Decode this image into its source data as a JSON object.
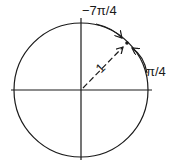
{
  "diagram": {
    "type": "unit-circle",
    "labels": {
      "top_angle": "−7π/4",
      "right_angle": "π/4",
      "radius": "1"
    },
    "colors": {
      "ink": "#1a1a1a",
      "background": "#ffffff"
    },
    "geometry": {
      "center": [
        81,
        90
      ],
      "radius": 67,
      "point_angle_deg": 45
    }
  }
}
